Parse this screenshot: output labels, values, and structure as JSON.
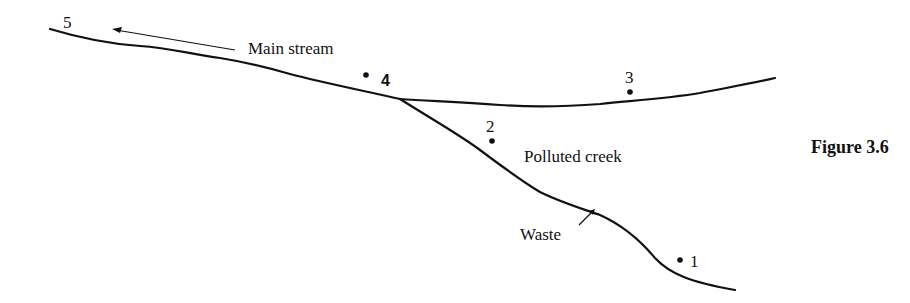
{
  "figure": {
    "caption": "Figure 3.6"
  },
  "labels": {
    "main_stream": "Main stream",
    "polluted_creek": "Polluted creek",
    "waste": "Waste"
  },
  "stations": [
    {
      "id": "1",
      "label": "1"
    },
    {
      "id": "2",
      "label": "2"
    },
    {
      "id": "3",
      "label": "3"
    },
    {
      "id": "4",
      "label": "4"
    },
    {
      "id": "5",
      "label": "5"
    }
  ],
  "colors": {
    "ink": "#111111",
    "background": "#ffffff"
  }
}
